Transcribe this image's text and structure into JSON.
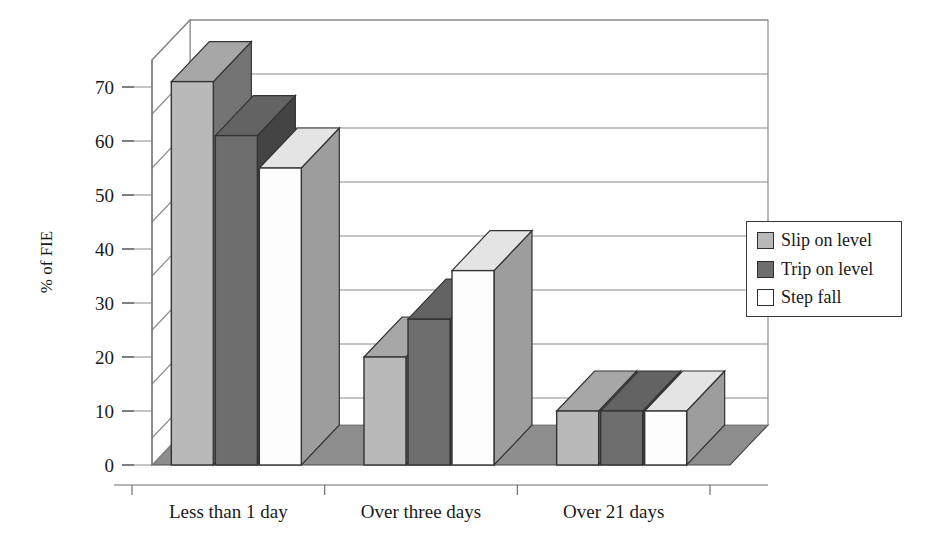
{
  "chart_data": {
    "type": "bar",
    "title": "",
    "xlabel": "",
    "ylabel": "% of FIE",
    "categories": [
      "Less than 1 day",
      "Over three days",
      "Over 21 days"
    ],
    "series": [
      {
        "name": "Slip on level",
        "values": [
          71,
          20,
          10
        ],
        "color": "#b9b9b9"
      },
      {
        "name": "Trip on level",
        "values": [
          61,
          27,
          10
        ],
        "color": "#6e6e6e"
      },
      {
        "name": "Step fall",
        "values": [
          55,
          36,
          10
        ],
        "color": "#fdfdfd"
      }
    ],
    "ylim": [
      0,
      75
    ],
    "yticks": [
      0,
      10,
      20,
      30,
      40,
      50,
      60,
      70
    ],
    "ytick_labels": [
      "0",
      "10",
      "20",
      "30",
      "40",
      "50",
      "60",
      "70"
    ],
    "gridlines": [
      5,
      15,
      25,
      35,
      45,
      55,
      65,
      75
    ],
    "grid": true,
    "legend_position": "right",
    "three_d": true
  },
  "legend": {
    "items": [
      {
        "label": "Slip on level",
        "swatch": "#b9b9b9"
      },
      {
        "label": "Trip on level",
        "swatch": "#6e6e6e"
      },
      {
        "label": "Step fall",
        "swatch": "#ffffff"
      }
    ]
  },
  "palette": {
    "floor": "#8d8d8d",
    "floor_edge": "#4a4a4a",
    "wall": "#ffffff",
    "wall_line": "#8a8a8a",
    "axis_line": "#6f6f6f",
    "bar_outline": "#333333",
    "side_dark": "#6e6e6e",
    "top_light": "#cfcfcf"
  }
}
